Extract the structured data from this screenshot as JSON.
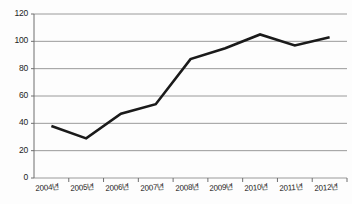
{
  "chart_data": {
    "type": "line",
    "title": "",
    "xlabel": "",
    "ylabel": "",
    "categories": [
      "2004년",
      "2005년",
      "2006년",
      "2007년",
      "2008년",
      "2009년",
      "2010년",
      "2011년",
      "2012년"
    ],
    "values": [
      38,
      29,
      47,
      54,
      87,
      95,
      105,
      97,
      103
    ],
    "series": [
      {
        "name": "series-1",
        "values": [
          38,
          29,
          47,
          54,
          87,
          95,
          105,
          97,
          103
        ]
      }
    ],
    "ylim": [
      0,
      120
    ],
    "yticks": [
      0,
      20,
      40,
      60,
      80,
      100,
      120
    ],
    "ytick_labels": [
      "0",
      "20",
      "40",
      "60",
      "80",
      "100",
      "120"
    ],
    "grid": "horizontal",
    "legend": "none",
    "line_color": "#1a1a1a",
    "grid_color": "#9a9a9a",
    "axis_color": "#6f6f6f",
    "background_color": "#fdfdfd"
  }
}
